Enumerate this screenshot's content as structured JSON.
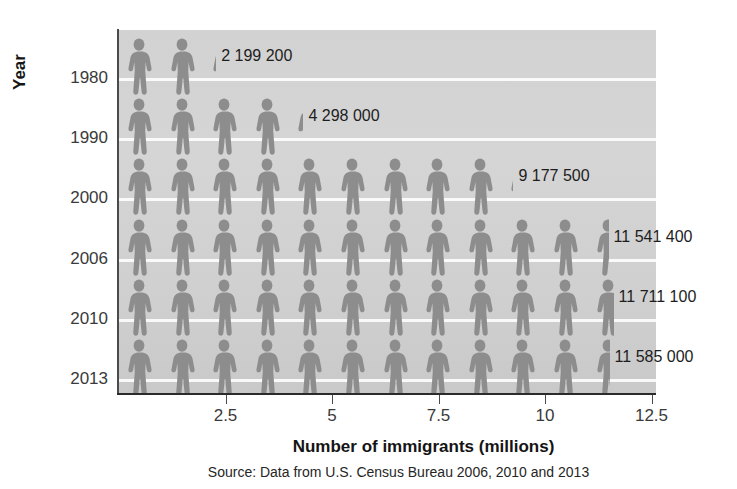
{
  "chart_data": {
    "type": "bar",
    "title": "",
    "subtitle": "",
    "xlabel": "Number of immigrants (millions)",
    "ylabel": "Year",
    "xlim": [
      0,
      12.9
    ],
    "xticks": [
      2.5,
      5,
      7.5,
      10,
      12.5
    ],
    "xtick_labels": [
      "2.5",
      "5",
      "7.5",
      "10",
      "12.5"
    ],
    "categories": [
      "1980",
      "1990",
      "2000",
      "2006",
      "2010",
      "2013"
    ],
    "values": [
      2.1992,
      4.298,
      9.1775,
      11.5414,
      11.7111,
      11.585
    ],
    "value_labels": [
      "2 199 200",
      "4 298 000",
      "9 177 500",
      "11 541 400",
      "11 711 100",
      "11 585 000"
    ],
    "icon_unit": 1,
    "icon_name": "person-icon",
    "icon_color": "#8e8e8e",
    "plot_background": "#d2d2d2",
    "gridline_color": "#ffffff",
    "grid": true,
    "legend": "none",
    "source": "Source: Data from U.S. Census Bureau 2006, 2010 and 2013"
  },
  "axes": {
    "y_title": "Year",
    "x_title": "Number of immigrants (millions)",
    "y_tick_labels": [
      "1980",
      "1990",
      "2000",
      "2006",
      "2010",
      "2013"
    ],
    "x_tick_labels": [
      "2.5",
      "5",
      "7.5",
      "10",
      "12.5"
    ]
  },
  "rows": [
    {
      "year": "1980",
      "label": "2 199 200",
      "full": 2,
      "partial": 0.2
    },
    {
      "year": "1990",
      "label": "4 298 000",
      "full": 4,
      "partial": 0.3
    },
    {
      "year": "2000",
      "label": "9 177 500",
      "full": 9,
      "partial": 0.18
    },
    {
      "year": "2006",
      "label": "11 541 400",
      "full": 11,
      "partial": 0.54
    },
    {
      "year": "2010",
      "label": "11 711 100",
      "full": 11,
      "partial": 0.71
    },
    {
      "year": "2013",
      "label": "11 585 000",
      "full": 11,
      "partial": 0.58
    }
  ],
  "footer": {
    "source": "Source: Data from U.S. Census Bureau 2006, 2010 and 2013"
  }
}
